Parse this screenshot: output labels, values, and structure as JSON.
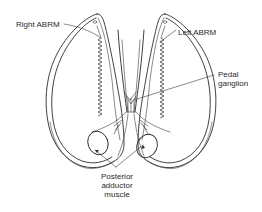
{
  "diagram": {
    "type": "anatomical-line-drawing",
    "colors": {
      "ink": "#2b2b2b",
      "background": "#ffffff"
    },
    "labels": {
      "right_abrm": "Right ABRM",
      "left_abrm": "Left ABRM",
      "pedal_ganglion_line1": "Pedal",
      "pedal_ganglion_line2": "ganglion",
      "posterior_line1": "Posterior",
      "posterior_line2": "adductor",
      "posterior_line3": "muscle"
    },
    "nodes": [
      {
        "id": "right-valve",
        "label": ""
      },
      {
        "id": "left-valve",
        "label": ""
      },
      {
        "id": "right-abrm",
        "label": "Right ABRM"
      },
      {
        "id": "left-abrm",
        "label": "Left ABRM"
      },
      {
        "id": "pedal-ganglion",
        "label": "Pedal ganglion"
      },
      {
        "id": "posterior-adductor-right",
        "label": "Posterior adductor muscle"
      },
      {
        "id": "posterior-adductor-left",
        "label": "Posterior adductor muscle"
      }
    ],
    "edges": [
      {
        "from": "Right ABRM label",
        "to": "right-abrm"
      },
      {
        "from": "Left ABRM label",
        "to": "left-abrm"
      },
      {
        "from": "Pedal ganglion label",
        "to": "pedal-ganglion"
      },
      {
        "from": "Posterior adductor muscle label",
        "to": "posterior-adductor-right"
      },
      {
        "from": "Posterior adductor muscle label",
        "to": "posterior-adductor-left"
      }
    ]
  }
}
